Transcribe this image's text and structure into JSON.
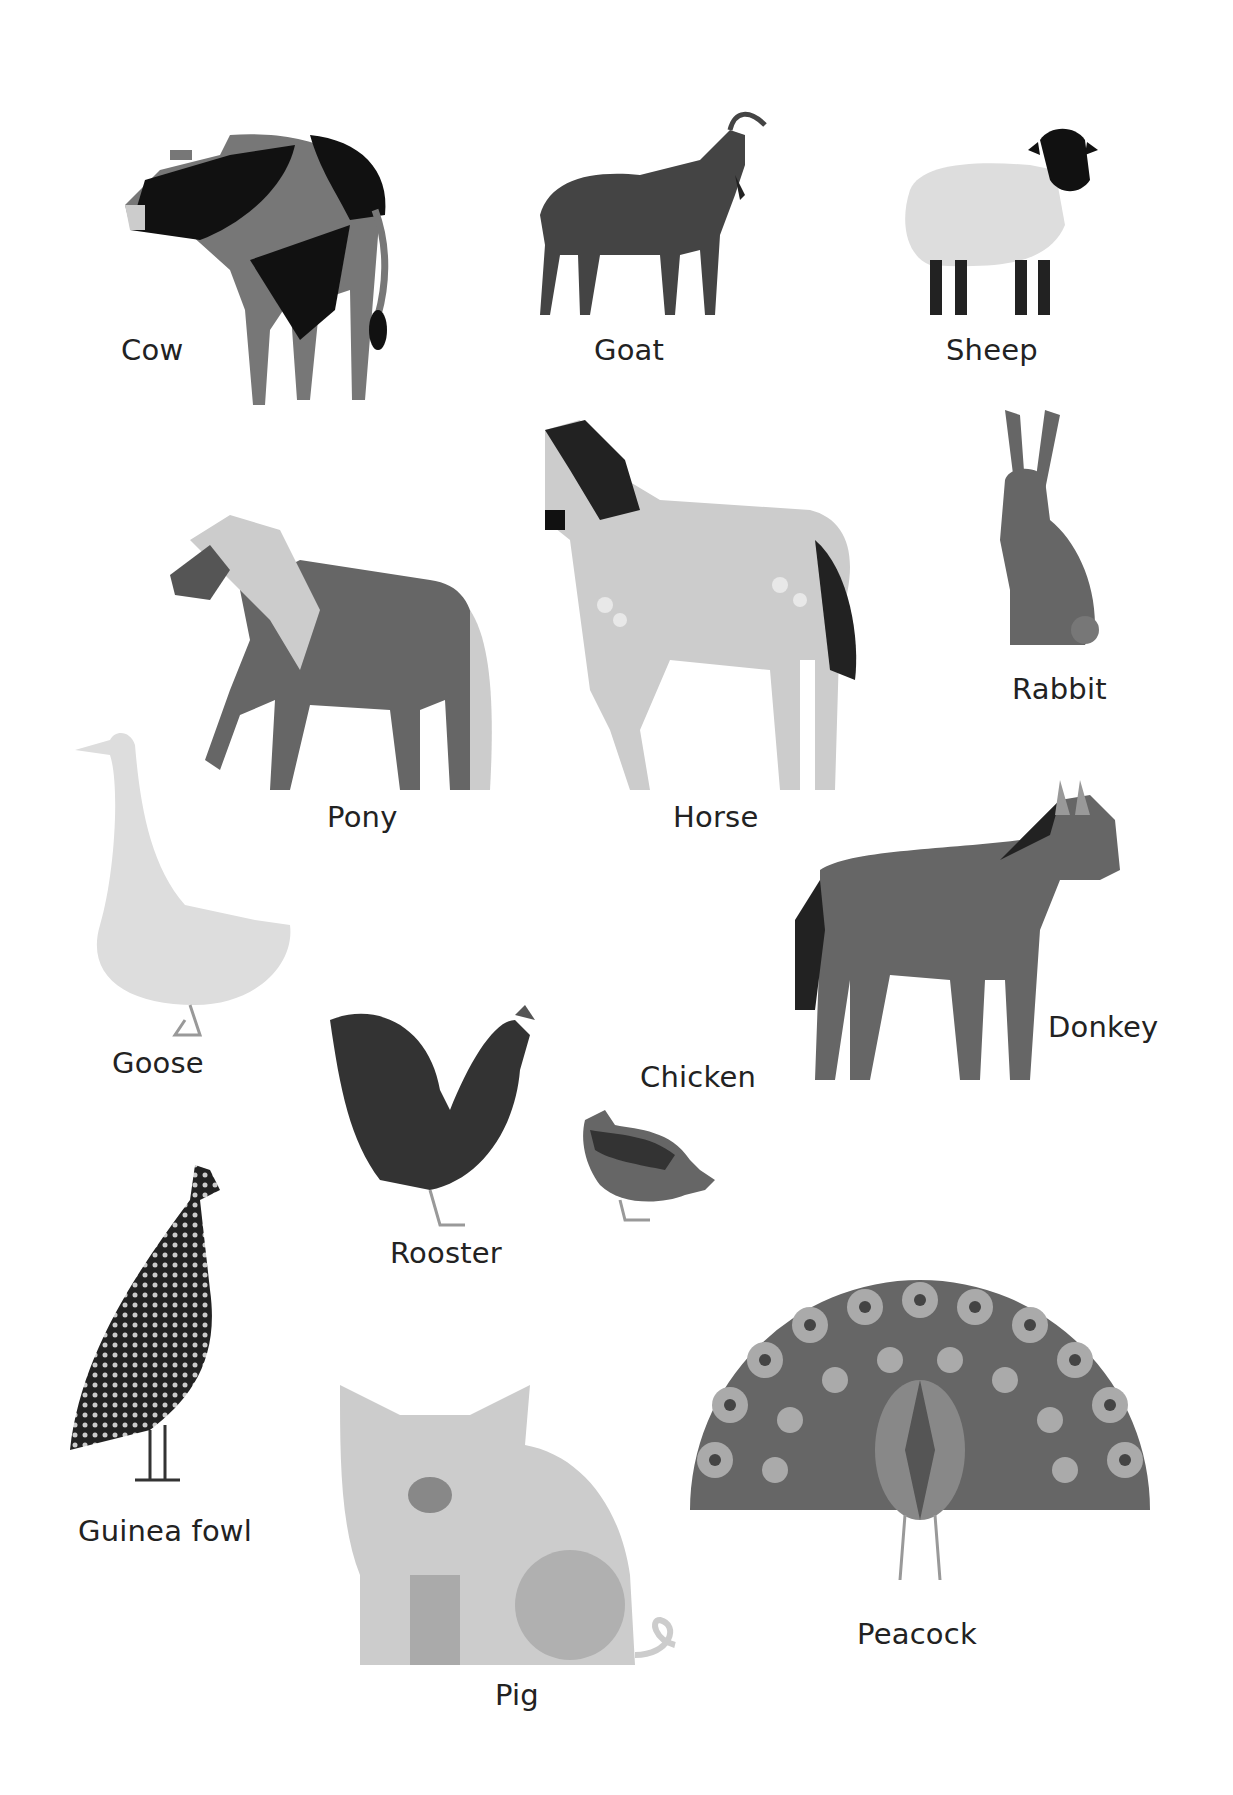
{
  "poster": {
    "animals": [
      {
        "id": "cow",
        "label": "Cow",
        "x": 121,
        "y": 350
      },
      {
        "id": "goat",
        "label": "Goat",
        "x": 594,
        "y": 350
      },
      {
        "id": "sheep",
        "label": "Sheep",
        "x": 946,
        "y": 350
      },
      {
        "id": "pony",
        "label": "Pony",
        "x": 327,
        "y": 816
      },
      {
        "id": "horse",
        "label": "Horse",
        "x": 673,
        "y": 816
      },
      {
        "id": "rabbit",
        "label": "Rabbit",
        "x": 1012,
        "y": 688
      },
      {
        "id": "goose",
        "label": "Goose",
        "x": 112,
        "y": 1062
      },
      {
        "id": "donkey",
        "label": "Donkey",
        "x": 1048,
        "y": 1026
      },
      {
        "id": "chicken",
        "label": "Chicken",
        "x": 640,
        "y": 1076
      },
      {
        "id": "rooster",
        "label": "Rooster",
        "x": 390,
        "y": 1252
      },
      {
        "id": "guinea_fowl",
        "label": "Guinea fowl",
        "x": 78,
        "y": 1530
      },
      {
        "id": "peacock",
        "label": "Peacock",
        "x": 857,
        "y": 1633
      },
      {
        "id": "pig",
        "label": "Pig",
        "x": 495,
        "y": 1694
      }
    ]
  },
  "colors": {
    "black": "#1a1a1a",
    "dark": "#555555",
    "mid": "#7a7a7a",
    "light": "#b5b5b5",
    "pale": "#d9d9d9"
  }
}
